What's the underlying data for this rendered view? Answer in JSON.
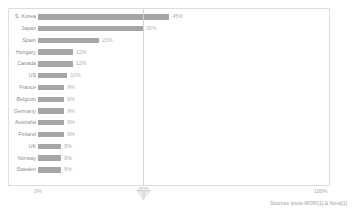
{
  "chart_data": {
    "type": "bar",
    "orientation": "horizontal",
    "title": "",
    "subtitle": "",
    "xlabel": "",
    "ylabel": "",
    "xlim": [
      0,
      100
    ],
    "grid": false,
    "legend": null,
    "categories": [
      "S. Korea",
      "Japan",
      "Spain",
      "Hungary",
      "Canada",
      "US",
      "France",
      "Belgium",
      "Germany",
      "Australia",
      "Finland",
      "UK",
      "Norway",
      "Sweden"
    ],
    "values": [
      45,
      36,
      21,
      12,
      12,
      10,
      9,
      9,
      9,
      9,
      9,
      8,
      8,
      8
    ],
    "value_labels": [
      "45%",
      "36%",
      "21%",
      "12%",
      "12%",
      "10%",
      "9%",
      "9%",
      "9%",
      "9%",
      "9%",
      "8%",
      "8%",
      "8%"
    ],
    "bars": [
      {
        "label": "S. Korea",
        "value": 45,
        "value_label": "45%"
      },
      {
        "label": "Japan",
        "value": 36,
        "value_label": "36%"
      },
      {
        "label": "Spain",
        "value": 21,
        "value_label": "21%"
      },
      {
        "label": "Hungary",
        "value": 12,
        "value_label": "12%"
      },
      {
        "label": "Canada",
        "value": 12,
        "value_label": "12%"
      },
      {
        "label": "US",
        "value": 10,
        "value_label": "10%"
      },
      {
        "label": "France",
        "value": 9,
        "value_label": "9%"
      },
      {
        "label": "Belgium",
        "value": 9,
        "value_label": "9%"
      },
      {
        "label": "Germany",
        "value": 9,
        "value_label": "9%"
      },
      {
        "label": "Australia",
        "value": 9,
        "value_label": "9%"
      },
      {
        "label": "Finland",
        "value": 9,
        "value_label": "9%"
      },
      {
        "label": "UK",
        "value": 8,
        "value_label": "8%"
      },
      {
        "label": "Norway",
        "value": 8,
        "value_label": "8%"
      },
      {
        "label": "Sweden",
        "value": 8,
        "value_label": "8%"
      }
    ],
    "reference_line": {
      "value": 36,
      "marker": "diamond-marker"
    },
    "axis": {
      "min_label": "0%",
      "max_label": "100%"
    },
    "colors": {
      "bar": "#a6a6a6",
      "reference_line": "#d4d4d4",
      "value_text": "#b0b0b0",
      "label_text": "#8a8a8a",
      "frame": "#dedede"
    }
  },
  "source": {
    "note": "Sources Ipsos-MORI[1] & Nova[1]"
  }
}
